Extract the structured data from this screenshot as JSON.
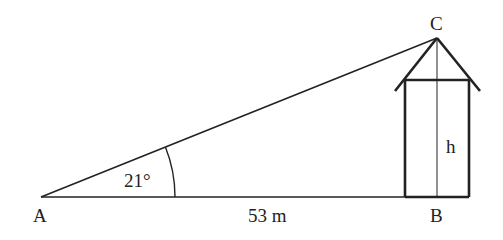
{
  "diagram": {
    "type": "right-triangle trigonometry",
    "points": {
      "A": {
        "label": "A"
      },
      "B": {
        "label": "B"
      },
      "C": {
        "label": "C"
      }
    },
    "angle_label": "21°",
    "base_label": "53 m",
    "height_label": "h",
    "stroke_color": "#222222",
    "background": "#ffffff"
  }
}
